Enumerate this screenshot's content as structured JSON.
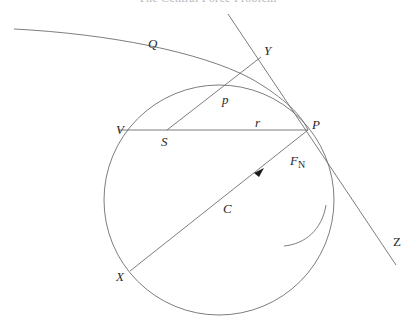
{
  "header": {
    "running_title": "The Central Force Problem"
  },
  "diagram": {
    "labels": {
      "Q": "Q",
      "Y": "Y",
      "p": "p",
      "V": "V",
      "S": "S",
      "r": "r",
      "P": "P",
      "F": "F",
      "F_sub": "N",
      "C": "C",
      "X": "X",
      "Z": "Z"
    },
    "points": {
      "S": [
        167,
        130
      ],
      "P": [
        308,
        130
      ],
      "V": [
        118,
        130
      ],
      "Y": [
        260,
        58
      ],
      "X": [
        130,
        271
      ],
      "Z": [
        396,
        265
      ],
      "circle_center": [
        219,
        200
      ],
      "circle_radius": 115
    },
    "colors": {
      "stroke": "#6e6e6e",
      "text": "#2a2a2a",
      "header": "#b8b8b8"
    }
  }
}
